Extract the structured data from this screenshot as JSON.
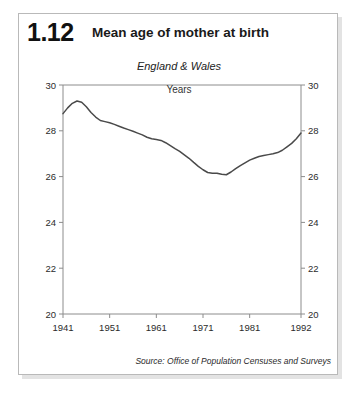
{
  "header": {
    "number": "1.12",
    "title": "Mean age of mother at birth"
  },
  "labels": {
    "region": "England & Wales",
    "units": "Years",
    "source": "Source: Office of Population Censuses and Surveys"
  },
  "colors": {
    "line": "#4a4a4a",
    "axis": "#8c8c8c",
    "text": "#2b2b2b",
    "card_border": "#b9b9b9",
    "background": "#ffffff"
  },
  "chart_data": {
    "type": "line",
    "title": "Mean age of mother at birth",
    "subtitle": "England & Wales",
    "xlabel": "",
    "ylabel": "Years",
    "xlim": [
      1941,
      1992
    ],
    "ylim": [
      20,
      30
    ],
    "grid": false,
    "legend": "none",
    "y_ticks": [
      20,
      22,
      24,
      26,
      28,
      30
    ],
    "y_ticks_right": [
      20,
      22,
      24,
      26,
      28,
      30
    ],
    "x_ticks": [
      1941,
      1951,
      1961,
      1971,
      1981,
      1992
    ],
    "x_tick_labels": [
      "1941",
      "1951",
      "1961",
      "1971",
      "1981",
      "1992"
    ],
    "series": [
      {
        "name": "Mean age of mother at birth",
        "x": [
          1941,
          1942,
          1943,
          1944,
          1945,
          1946,
          1947,
          1948,
          1949,
          1950,
          1951,
          1952,
          1953,
          1954,
          1955,
          1956,
          1957,
          1958,
          1959,
          1960,
          1961,
          1962,
          1963,
          1964,
          1965,
          1966,
          1967,
          1968,
          1969,
          1970,
          1971,
          1972,
          1973,
          1974,
          1975,
          1976,
          1977,
          1978,
          1979,
          1980,
          1981,
          1982,
          1983,
          1984,
          1985,
          1986,
          1987,
          1988,
          1989,
          1990,
          1991,
          1992
        ],
        "values": [
          28.75,
          29.0,
          29.2,
          29.3,
          29.25,
          29.05,
          28.8,
          28.6,
          28.45,
          28.4,
          28.35,
          28.28,
          28.2,
          28.12,
          28.05,
          27.98,
          27.9,
          27.82,
          27.72,
          27.65,
          27.62,
          27.58,
          27.48,
          27.35,
          27.22,
          27.1,
          26.95,
          26.8,
          26.62,
          26.45,
          26.3,
          26.18,
          26.15,
          26.15,
          26.1,
          26.08,
          26.2,
          26.35,
          26.48,
          26.6,
          26.72,
          26.8,
          26.88,
          26.92,
          26.96,
          27.0,
          27.05,
          27.15,
          27.3,
          27.45,
          27.65,
          27.9
        ]
      }
    ]
  }
}
